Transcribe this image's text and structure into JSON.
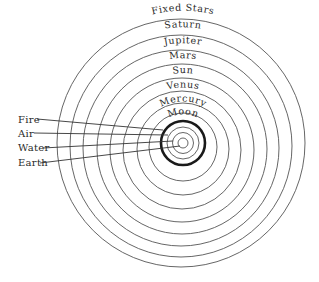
{
  "diagram": {
    "title": "",
    "celestial_spheres": [
      {
        "label": "Fixed Stars"
      },
      {
        "label": "Saturn"
      },
      {
        "label": "Jupiter"
      },
      {
        "label": "Mars"
      },
      {
        "label": "Sun"
      },
      {
        "label": "Venus"
      },
      {
        "label": "Mercury"
      },
      {
        "label": "Moon"
      }
    ],
    "elements": [
      {
        "label": "Fire"
      },
      {
        "label": "Air"
      },
      {
        "label": "Water"
      },
      {
        "label": "Earth"
      }
    ],
    "colors": {
      "ring": "#555555",
      "thick_ring": "#1a1a1a",
      "text": "#2a2a2a",
      "background": "#ffffff"
    }
  }
}
